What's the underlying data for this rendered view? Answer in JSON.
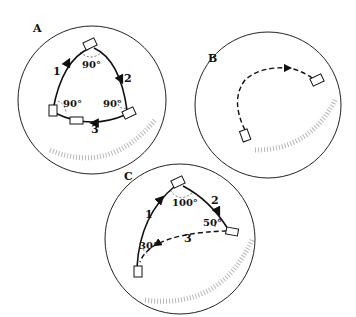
{
  "panels": [
    {
      "id": "A",
      "label": "A",
      "segments": [
        "1",
        "2",
        "3"
      ],
      "angles": [
        "90°",
        "90°",
        "90°"
      ]
    },
    {
      "id": "B",
      "label": "B"
    },
    {
      "id": "C",
      "label": "C",
      "segments": [
        "1",
        "2",
        "3"
      ],
      "angles": [
        "100°",
        "50°",
        "30°"
      ]
    }
  ]
}
